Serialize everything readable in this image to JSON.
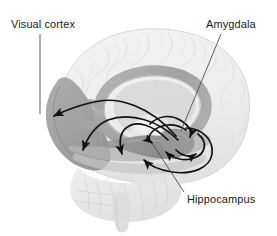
{
  "figure": {
    "view": "mid-sagittal / lateral cutaway of human brain",
    "width": 277,
    "height": 236,
    "background_color": "#ffffff"
  },
  "labels": [
    {
      "id": "visual-cortex",
      "text": "Visual cortex",
      "position": "top-left",
      "leader_line": "vertical, from text down to occipital region"
    },
    {
      "id": "amygdala",
      "text": "Amygdala",
      "position": "top-right",
      "leader_line": "diagonal, from text down-left to amygdala body"
    },
    {
      "id": "hippocampus",
      "text": "Hippocampus",
      "position": "bottom-right",
      "leader_line": "diagonal, from text up-left to hippocampal body"
    }
  ],
  "regions": [
    {
      "id": "cerebrum-outline",
      "name": "Cerebral cortex (ghosted outline)",
      "color": "#eeeeee"
    },
    {
      "id": "visual-cortex",
      "name": "Visual cortex (occipital lobe)",
      "color": "#9c9c9c"
    },
    {
      "id": "limbic-ring",
      "name": "Cingulate gyrus / fornix ring",
      "color": "#a8a8a8"
    },
    {
      "id": "corpus-callosum",
      "name": "Corpus callosum",
      "color": "#c9c9c9"
    },
    {
      "id": "thalamus",
      "name": "Thalamus",
      "color": "#d8d8d8"
    },
    {
      "id": "hippocampus",
      "name": "Hippocampus",
      "color": "#8f8f8f"
    },
    {
      "id": "amygdala",
      "name": "Amygdala",
      "color": "#9a9a9a"
    },
    {
      "id": "cerebellum",
      "name": "Cerebellum",
      "color": "#e2e2e2"
    },
    {
      "id": "brainstem",
      "name": "Brainstem",
      "color": "#dedede"
    }
  ],
  "pathways": {
    "arrow_color": "#111111",
    "description": "Curved arrows showing reciprocal projections between the amygdala/hippocampus complex and the visual cortex, plus local recurrent loops within the medial temporal lobe.",
    "arrows": [
      {
        "id": "amygdala-to-visual-cortex",
        "from": "amygdala",
        "to": "visual-cortex",
        "direction": "feedback"
      },
      {
        "id": "amygdala-to-temporal",
        "from": "amygdala",
        "to": "temporal-cortex",
        "direction": "feedback"
      },
      {
        "id": "hippocampus-to-temporal",
        "from": "hippocampus",
        "to": "temporal-pole",
        "direction": "feedback"
      },
      {
        "id": "visual-to-amygdala",
        "from": "visual-cortex",
        "to": "amygdala",
        "direction": "feedforward"
      },
      {
        "id": "local-loop-upper",
        "from": "amygdala",
        "to": "hippocampus",
        "direction": "recurrent"
      },
      {
        "id": "local-loop-lower",
        "from": "hippocampus",
        "to": "amygdala",
        "direction": "recurrent"
      },
      {
        "id": "entorhinal-loop",
        "from": "amygdala",
        "to": "entorhinal",
        "direction": "recurrent"
      }
    ]
  },
  "colors": {
    "text": "#1c1c1c",
    "leader_line": "#555555",
    "arrow": "#111111",
    "background": "#ffffff"
  }
}
